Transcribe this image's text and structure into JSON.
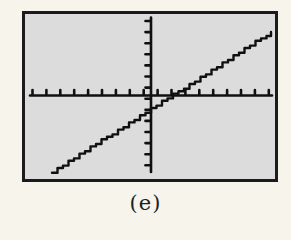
{
  "page": {
    "background": "#f7f4ec"
  },
  "figure_label": {
    "text": "(e)"
  },
  "colors": {
    "screen_bg": "#dcdcdc",
    "screen_border": "#1b1b1b",
    "ink": "#101010",
    "label": "#1e1e1e"
  },
  "screen_px": {
    "x": 22,
    "y": 11,
    "width": 256,
    "height": 171,
    "border_width": 3
  },
  "chart_data": {
    "type": "line",
    "title": "",
    "xlabel": "",
    "ylabel": "",
    "grid": false,
    "legend": null,
    "axis_px": {
      "x_axis": {
        "y": 95.5,
        "x_start": 30,
        "x_end": 272,
        "tick_count": 18,
        "tick_start_x": 32.5,
        "tick_spacing": 13.9,
        "tick_len": 4.5,
        "tick_side": "above"
      },
      "y_axis": {
        "x": 151,
        "y_start": 17.5,
        "y_end": 172,
        "tick_count": 14,
        "tick_start_y": 21,
        "tick_spacing": 11.1,
        "tick_len": 4.5,
        "tick_side": "left"
      }
    },
    "line_px": {
      "x1": 52,
      "y1": 172,
      "x2": 271,
      "y2": 32
    },
    "math": {
      "slope_sign": "positive",
      "x_intercept_est": 1.6,
      "y_intercept_est": -1.3,
      "window_est": {
        "xmin": -9,
        "xmax": 9,
        "ymin": -7,
        "ymax": 7
      }
    }
  }
}
